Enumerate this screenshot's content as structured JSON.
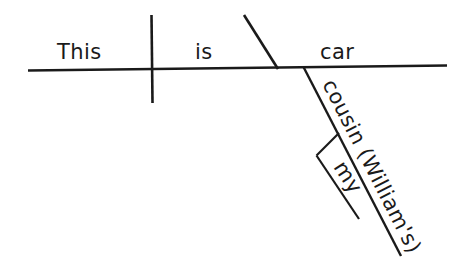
{
  "diagram": {
    "type": "reed-kellogg-sentence-diagram",
    "sentence": "This is my cousin William's car.",
    "background_color": "#ffffff",
    "line_color": "#1a1a1a",
    "labels": {
      "subject": "This",
      "verb": "is",
      "predicate_nominative": "car",
      "possessive_modifier": "cousin (William's)",
      "determiner": "my"
    },
    "lines": {
      "baseline": {
        "x1": 28,
        "y1": 70.5,
        "x2": 447,
        "y2": 65.5,
        "width": 2.6
      },
      "subject_verb_divider": {
        "x1": 151.5,
        "y1": 15,
        "x2": 152.5,
        "y2": 103,
        "width": 2.6
      },
      "predicate_nominative_slant": {
        "x1": 244,
        "y1": 15,
        "x2": 278,
        "y2": 69,
        "width": 2.6
      },
      "possessive_diagonal": {
        "x1": 303.5,
        "y1": 67,
        "x2": 401,
        "y2": 256,
        "width": 2.4
      },
      "determiner_connector": {
        "x1": 339,
        "y1": 133,
        "x2": 316.5,
        "y2": 155.5,
        "width": 2.2
      },
      "determiner_diagonal": {
        "x1": 316.5,
        "y1": 155.5,
        "x2": 359,
        "y2": 219,
        "width": 2.2
      }
    },
    "label_positions": {
      "subject": {
        "x": 57,
        "y": 59,
        "rotation": 0
      },
      "verb": {
        "x": 195,
        "y": 59,
        "rotation": 0
      },
      "predicate_nominative": {
        "x": 320,
        "y": 59,
        "rotation": 0
      },
      "possessive_modifier": {
        "x": 322,
        "y": 84,
        "rotation": 63
      },
      "determiner": {
        "x": 333,
        "y": 167,
        "rotation": 57
      }
    }
  }
}
